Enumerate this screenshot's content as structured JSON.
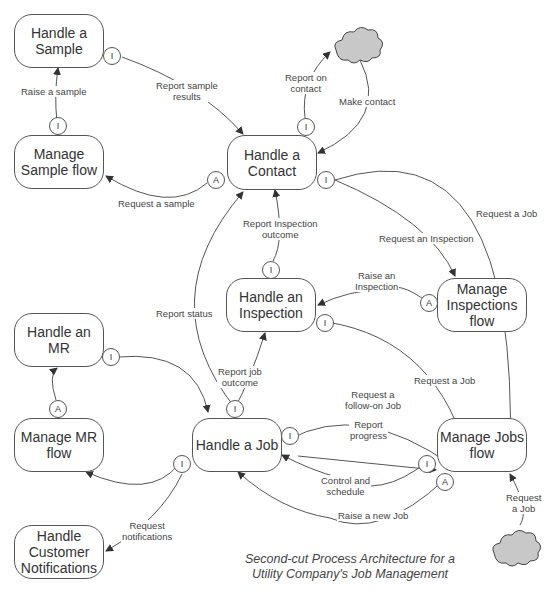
{
  "diagram": {
    "title": "Second-cut Process Architecture for a\nUtility Company's Job Management",
    "nodes": {
      "handle_sample": "Handle a\nSample",
      "manage_sample_flow": "Manage\nSample flow",
      "handle_contact": "Handle a\nContact",
      "handle_inspection": "Handle an\nInspection",
      "manage_inspections_flow": "Manage\nInspections\nflow",
      "handle_mr": "Handle an\nMR",
      "manage_mr_flow": "Manage MR\nflow",
      "handle_job": "Handle a Job",
      "manage_jobs_flow": "Manage Jobs\nflow",
      "handle_customer_notifications": "Handle\nCustomer\nNotifications"
    },
    "external_entities": [
      {
        "id": "cloud-top",
        "icon": "cloud-icon"
      },
      {
        "id": "cloud-bottom",
        "icon": "cloud-icon"
      }
    ],
    "port_labels": {
      "interaction": "I",
      "activation": "A"
    },
    "edges": {
      "raise_sample": "Raise a sample",
      "report_sample_results": "Report sample\nresults",
      "request_sample": "Request a sample",
      "report_on_contact": "Report on\ncontact",
      "make_contact": "Make contact",
      "request_job_contact": "Request a Job",
      "request_inspection": "Request an Inspection",
      "report_inspection_outcome": "Report Inspection\noutcome",
      "raise_inspection": "Raise an\nInspection",
      "report_status": "Report status",
      "request_job_inspection": "Request a Job",
      "report_job_outcome": "Report job\noutcome",
      "request_followon_job": "Request a\nfollow-on Job",
      "report_progress": "Report\nprogress",
      "control_schedule": "Control and\nschedule",
      "raise_new_job": "Raise a new Job",
      "request_job_external": "Request\na Job",
      "request_notifications": "Request\nnotifications"
    }
  },
  "colors": {
    "line": "#555555",
    "cloud_fill": "#c8c8c8",
    "text": "#333333"
  }
}
